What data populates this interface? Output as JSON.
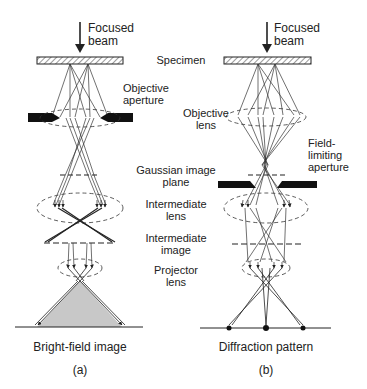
{
  "panels": [
    {
      "id": "a",
      "beam_label_1": "Focused",
      "beam_label_2": "beam",
      "bottom_label": "Bright-field image",
      "panel_label": "(a)"
    },
    {
      "id": "b",
      "beam_label_1": "Focused",
      "beam_label_2": "beam",
      "bottom_label": "Diffraction pattern",
      "panel_label": "(b)"
    }
  ],
  "center_labels": {
    "specimen": "Specimen",
    "objective_aperture_1": "Objective",
    "objective_aperture_2": "aperture",
    "objective_lens_1": "Objective",
    "objective_lens_2": "lens",
    "gaussian_1": "Gaussian image",
    "gaussian_2": "plane",
    "intermediate_lens_1": "Intermediate",
    "intermediate_lens_2": "lens",
    "intermediate_image_1": "Intermediate",
    "intermediate_image_2": "image",
    "projector_1": "Projector",
    "projector_2": "lens"
  },
  "right_labels": {
    "field_limiting_1": "Field-",
    "field_limiting_2": "limiting",
    "field_limiting_3": "aperture"
  },
  "colors": {
    "line": "#222222",
    "aperture": "#111111",
    "image_fill": "#c8c8c8"
  }
}
